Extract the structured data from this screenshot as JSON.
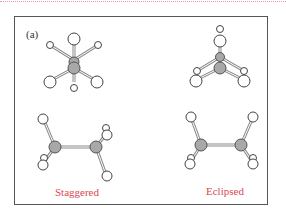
{
  "figure": {
    "panel_label": "(a)",
    "captions": {
      "staggered": "Staggered",
      "eclipsed": "Eclipsed"
    },
    "colors": {
      "frame": "#555555",
      "caption": "#d9474f",
      "carbon": "#a8a8a8",
      "hydrogen": "#ffffff",
      "bond": "#888888"
    },
    "molecules": [
      {
        "name": "staggered-end-view"
      },
      {
        "name": "eclipsed-end-view"
      },
      {
        "name": "staggered-side-view"
      },
      {
        "name": "eclipsed-side-view"
      }
    ]
  }
}
